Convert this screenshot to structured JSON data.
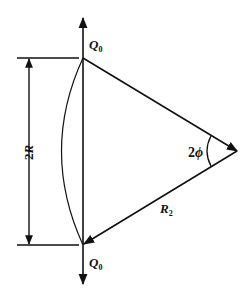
{
  "diagram": {
    "type": "mechanics-geometry",
    "colors": {
      "stroke": "#111111",
      "background": "#ffffff"
    },
    "labels": {
      "force_top": {
        "main": "Q",
        "sub": "0"
      },
      "force_bottom": {
        "main": "Q",
        "sub": "0"
      },
      "chord_dimension": {
        "prefix": "2",
        "var": "R"
      },
      "angle": {
        "prefix": "2",
        "var": "ϕ"
      },
      "radius": {
        "main": "R",
        "sub": "2"
      }
    },
    "elements": [
      "vertical chord of length 2R",
      "circular arc bulging left between chord endpoints",
      "upward force arrow Q0 at top endpoint",
      "downward force arrow Q0 at bottom endpoint",
      "line from top endpoint to apex (arrowhead at apex)",
      "radius line R2 from apex to bottom endpoint (arrowhead at bottom)",
      "angle arc 2phi at apex",
      "dimension line 2R with arrows and extension ticks"
    ]
  }
}
